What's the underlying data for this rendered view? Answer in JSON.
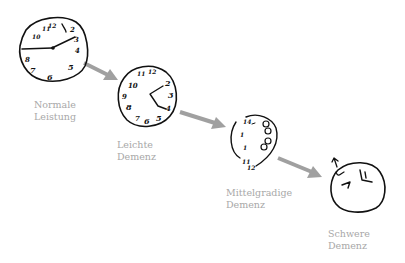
{
  "arrow_color": "#a0a0a0",
  "label_color": "#a8a8a8",
  "stages": [
    {
      "line1": "Normale",
      "line2": "Leistung"
    },
    {
      "line1": "Leichte",
      "line2": "Demenz"
    },
    {
      "line1": "Mittelgradige",
      "line2": "Demenz"
    },
    {
      "line1": "Schwere",
      "line2": "Demenz"
    }
  ]
}
